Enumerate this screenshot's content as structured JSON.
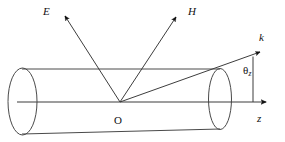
{
  "figure": {
    "background_color": "#ffffff",
    "line_color": "#3d3d3d",
    "cylinder_color": "#4a4a4a",
    "arrow_color": "#111111",
    "width": 285,
    "height": 142
  },
  "labels": {
    "e_vector": "E",
    "h_vector": "H",
    "k_vector": "k",
    "origin": "O",
    "z_axis": "z",
    "theta": "θ",
    "theta_subscript": "z"
  },
  "geometry": {
    "origin": {
      "x": 120,
      "y": 102
    },
    "cylinder": {
      "left_ellipse": {
        "cx": 22.5,
        "cy": 101.5,
        "rx": 14.5,
        "ry": 33.5
      },
      "right_ellipse": {
        "cx": 220,
        "cy": 99,
        "rx": 11.5,
        "ry": 30.5
      },
      "top_line": {
        "x1": 22,
        "y1": 69,
        "x2": 220,
        "y2": 69
      },
      "bottom_line": {
        "x1": 22,
        "y1": 134,
        "x2": 220,
        "y2": 129
      }
    },
    "axis": {
      "x1": 17,
      "y1": 102,
      "x2": 268,
      "y2": 102
    },
    "rays": [
      {
        "name": "e_ray",
        "x1": 120,
        "y1": 102,
        "x2": 64,
        "y2": 15
      },
      {
        "name": "h_ray",
        "x1": 120,
        "y1": 102,
        "x2": 177,
        "y2": 16
      },
      {
        "name": "k_ray",
        "x1": 120,
        "y1": 102,
        "x2": 262,
        "y2": 51
      }
    ],
    "angle_tick": {
      "x1": 253,
      "y1": 56,
      "x2": 253,
      "y2": 102
    }
  },
  "label_positions": {
    "e_vector": {
      "left": 43,
      "top": 6
    },
    "h_vector": {
      "left": 188,
      "top": 6
    },
    "k_vector": {
      "left": 259,
      "top": 33
    },
    "origin": {
      "left": 114,
      "top": 115
    },
    "z_axis": {
      "left": 257,
      "top": 114
    },
    "theta": {
      "left": 243,
      "top": 66
    }
  }
}
